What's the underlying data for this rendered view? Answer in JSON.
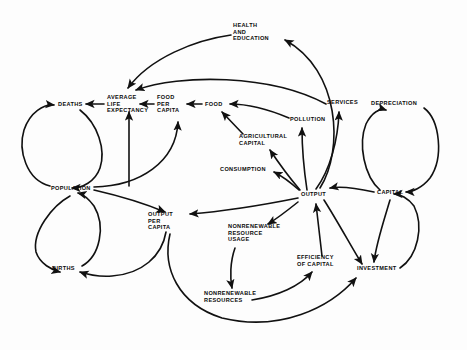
{
  "diagram": {
    "type": "causal-loop-diagram",
    "background_color": "#fdfdfd",
    "line_color": "#111111",
    "text_color": "#0a0a0a",
    "nodes": [
      {
        "id": "health_and_education",
        "label": "HEALTH\nAND\nEDUCATION",
        "lines": [
          "HEALTH",
          "AND",
          "EDUCATION"
        ],
        "x": 233,
        "y": 27,
        "anchor": "start"
      },
      {
        "id": "deaths",
        "label": "DEATHS",
        "lines": [
          "DEATHS"
        ],
        "x": 58,
        "y": 106,
        "anchor": "start"
      },
      {
        "id": "average_life_expectancy",
        "label": "AVERAGE\nLIFE\nEXPECTANCY",
        "lines": [
          "AVERAGE",
          "LIFE",
          "EXPECTANCY"
        ],
        "x": 107,
        "y": 99,
        "anchor": "start"
      },
      {
        "id": "food_per_capita",
        "label": "FOOD\nPER\nCAPITA",
        "lines": [
          "FOOD",
          "PER",
          "CAPITA"
        ],
        "x": 157,
        "y": 99,
        "anchor": "start"
      },
      {
        "id": "food",
        "label": "FOOD",
        "lines": [
          "FOOD"
        ],
        "x": 205,
        "y": 106,
        "anchor": "start"
      },
      {
        "id": "pollution",
        "label": "POLLUTION",
        "lines": [
          "POLLUTION"
        ],
        "x": 290,
        "y": 121,
        "anchor": "start"
      },
      {
        "id": "services",
        "label": "SERVICES",
        "lines": [
          "SERVICES"
        ],
        "x": 327,
        "y": 104,
        "anchor": "start"
      },
      {
        "id": "depreciation",
        "label": "DEPRECIATION",
        "lines": [
          "DEPRECIATION"
        ],
        "x": 371,
        "y": 105,
        "anchor": "start"
      },
      {
        "id": "agricultural_capital",
        "label": "AGRICULTURAL\nCAPITAL",
        "lines": [
          "AGRICULTURAL",
          "CAPITAL"
        ],
        "x": 239,
        "y": 138,
        "anchor": "start"
      },
      {
        "id": "consumption",
        "label": "CONSUMPTION",
        "lines": [
          "CONSUMPTION"
        ],
        "x": 220,
        "y": 171,
        "anchor": "start"
      },
      {
        "id": "population",
        "label": "POPULATION",
        "lines": [
          "POPULATION"
        ],
        "x": 51,
        "y": 190,
        "anchor": "start"
      },
      {
        "id": "output",
        "label": "OUTPUT",
        "lines": [
          "OUTPUT"
        ],
        "x": 301,
        "y": 196,
        "anchor": "start"
      },
      {
        "id": "capital",
        "label": "CAPITAL",
        "lines": [
          "CAPITAL"
        ],
        "x": 377,
        "y": 194,
        "anchor": "start"
      },
      {
        "id": "output_per_capita",
        "label": "OUTPUT\nPER\nCAPITA",
        "lines": [
          "OUTPUT",
          "PER",
          "CAPITA"
        ],
        "x": 148,
        "y": 216,
        "anchor": "start"
      },
      {
        "id": "nonrenewable_resource_usage",
        "label": "NONRENEWABLE\nRESOURCE\nUSAGE",
        "lines": [
          "NONRENEWABLE",
          "RESOURCE",
          "USAGE"
        ],
        "x": 228,
        "y": 228,
        "anchor": "start"
      },
      {
        "id": "efficiency_of_capital",
        "label": "EFFICIENCY\nOF CAPITAL",
        "lines": [
          "EFFICIENCY",
          "OF CAPITAL"
        ],
        "x": 297,
        "y": 259,
        "anchor": "start"
      },
      {
        "id": "investment",
        "label": "INVESTMENT",
        "lines": [
          "INVESTMENT"
        ],
        "x": 357,
        "y": 270,
        "anchor": "start"
      },
      {
        "id": "births",
        "label": "BIRTHS",
        "lines": [
          "BIRTHS"
        ],
        "x": 52,
        "y": 270,
        "anchor": "start"
      },
      {
        "id": "nonrenewable_resources",
        "label": "NONRENEWABLE\nRESOURCES",
        "lines": [
          "NONRENEWABLE",
          "RESOURCES"
        ],
        "x": 204,
        "y": 295,
        "anchor": "start"
      }
    ],
    "edges": [
      {
        "id": "population-to-deaths",
        "from": "population",
        "to": "deaths",
        "path": "M 50 186 C 26 180 18 150 24 130 C 30 112 44 104 54 105"
      },
      {
        "id": "deaths-to-population",
        "from": "deaths",
        "to": "population",
        "path": "M 80 110 C 98 124 106 150 100 168 C 95 182 82 188 72 188"
      },
      {
        "id": "average-life-expectancy-to-deaths",
        "from": "average_life_expectancy",
        "to": "deaths",
        "path": "M 104 104 L 86 104"
      },
      {
        "id": "population-to-average-life-expectancy",
        "from": "population",
        "to": "average_life_expectancy",
        "path": "M 129 186 L 129 112"
      },
      {
        "id": "food-per-capita-to-average-life-expectancy",
        "from": "food_per_capita",
        "to": "average_life_expectancy",
        "path": "M 154 104 L 140 104"
      },
      {
        "id": "food-to-food-per-capita",
        "from": "food",
        "to": "food_per_capita",
        "path": "M 202 104 L 187 104"
      },
      {
        "id": "population-to-food-per-capita",
        "from": "population",
        "to": "food_per_capita",
        "path": "M 94 187 C 140 186 176 162 178 122"
      },
      {
        "id": "agricultural-capital-to-food",
        "from": "agricultural_capital",
        "to": "food",
        "path": "M 243 134 L 222 112"
      },
      {
        "id": "pollution-to-food",
        "from": "pollution",
        "to": "food",
        "path": "M 289 118 C 270 110 248 104 230 104"
      },
      {
        "id": "output-to-agricultural-capital",
        "from": "output",
        "to": "agricultural_capital",
        "path": "M 300 190 C 288 176 278 162 270 150"
      },
      {
        "id": "output-to-consumption",
        "from": "output",
        "to": "consumption",
        "path": "M 299 190 C 290 182 282 176 274 172"
      },
      {
        "id": "output-to-pollution",
        "from": "output",
        "to": "pollution",
        "path": "M 307 190 C 304 170 302 148 302 128"
      },
      {
        "id": "output-to-services",
        "from": "output",
        "to": "services",
        "path": "M 316 189 C 330 170 338 140 339 112"
      },
      {
        "id": "output-to-health-and-education",
        "from": "output",
        "to": "health_and_education",
        "path": "M 320 188 C 344 150 340 70 285 40"
      },
      {
        "id": "health-and-education-to-average-life-expectancy",
        "from": "health_and_education",
        "to": "average_life_expectancy",
        "path": "M 231 35 C 195 40 150 58 128 88"
      },
      {
        "id": "services-to-average-life-expectancy",
        "from": "services",
        "to": "average_life_expectancy",
        "path": "M 326 104 C 270 74 180 74 136 90"
      },
      {
        "id": "capital-to-output",
        "from": "capital",
        "to": "output",
        "path": "M 374 192 C 356 188 340 186 330 188"
      },
      {
        "id": "capital-to-depreciation",
        "from": "capital",
        "to": "depreciation",
        "path": "M 380 190 C 364 176 358 144 366 124 C 372 112 380 108 386 110"
      },
      {
        "id": "depreciation-to-capital",
        "from": "depreciation",
        "to": "capital",
        "path": "M 424 108 C 440 120 444 158 430 178 C 422 188 412 192 406 192"
      },
      {
        "id": "investment-to-capital",
        "from": "investment",
        "to": "capital",
        "path": "M 400 268 C 418 256 424 226 414 206 C 408 198 400 194 394 194"
      },
      {
        "id": "capital-to-investment",
        "from": "capital",
        "to": "investment",
        "path": "M 390 200 C 384 220 376 244 374 262"
      },
      {
        "id": "output-to-investment",
        "from": "output",
        "to": "investment",
        "path": "M 324 200 C 338 222 352 248 362 264"
      },
      {
        "id": "efficiency-of-capital-to-output",
        "from": "efficiency_of_capital",
        "to": "output",
        "path": "M 322 256 C 320 238 318 220 316 204"
      },
      {
        "id": "nonrenewable-resources-to-efficiency-of-capital",
        "from": "nonrenewable_resources",
        "to": "efficiency_of_capital",
        "path": "M 252 300 C 278 296 300 286 312 272"
      },
      {
        "id": "output-to-nonrenewable-resource-usage",
        "from": "output",
        "to": "nonrenewable_resource_usage",
        "path": "M 298 202 C 288 210 278 218 268 224"
      },
      {
        "id": "nonrenewable-resource-usage-to-nonrenewable-resources",
        "from": "nonrenewable_resource_usage",
        "to": "nonrenewable_resources",
        "path": "M 235 248 C 230 262 230 278 232 288"
      },
      {
        "id": "output-to-output-per-capita",
        "from": "output",
        "to": "output_per_capita",
        "path": "M 298 198 C 258 206 216 212 190 214"
      },
      {
        "id": "population-to-output-per-capita",
        "from": "population",
        "to": "output_per_capita",
        "path": "M 94 190 C 120 196 146 204 165 212"
      },
      {
        "id": "output-per-capita-to-births",
        "from": "output_per_capita",
        "to": "births",
        "path": "M 166 232 C 162 256 142 274 112 276 C 96 277 86 274 80 272"
      },
      {
        "id": "population-to-births",
        "from": "population",
        "to": "births",
        "path": "M 70 196 C 52 206 32 232 36 252 C 40 264 52 270 60 272"
      },
      {
        "id": "births-to-population",
        "from": "births",
        "to": "population",
        "path": "M 82 266 C 100 256 106 226 94 206 C 88 198 82 194 78 193"
      },
      {
        "id": "output-per-capita-to-nonrenewable-resources-loop",
        "from": "output_per_capita",
        "to": "investment",
        "path": "M 170 234 C 162 268 178 304 222 318 C 280 332 330 308 356 278"
      }
    ]
  }
}
